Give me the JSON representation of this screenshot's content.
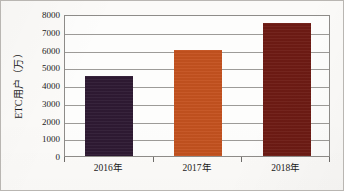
{
  "chart_data": {
    "type": "bar",
    "title": "",
    "subtitle": "",
    "xlabel": "",
    "ylabel": "ETC用户（万）",
    "categories": [
      "2016年",
      "2017年",
      "2018年"
    ],
    "values": [
      4500,
      6000,
      7500
    ],
    "series": [
      {
        "name": "ETC用户（万）",
        "values": [
          4500,
          6000,
          7500
        ]
      }
    ],
    "ylim": [
      0,
      8000
    ],
    "ytick_step": 1000,
    "ytick_labels": [
      "0",
      "1000",
      "2000",
      "3000",
      "4000",
      "5000",
      "6000",
      "7000",
      "8000"
    ],
    "ytick_values": [
      0,
      1000,
      2000,
      3000,
      4000,
      5000,
      6000,
      7000,
      8000
    ],
    "grid": true,
    "grid_axis": "y",
    "legend": false,
    "legend_position": "none",
    "bar_colors": [
      "#2e1a33",
      "#c4521f",
      "#6e1b14"
    ],
    "annotations": []
  },
  "style": {
    "figure_background": "#fbfaf8",
    "plot_background": "#fdfdfc",
    "figure_border_color": "#b9b6b2",
    "plot_border_color": "#8e8c89",
    "gridline_color": "#9d9b98",
    "tick_color": "#6f6d6b",
    "text_color": "#1b1b1b"
  }
}
